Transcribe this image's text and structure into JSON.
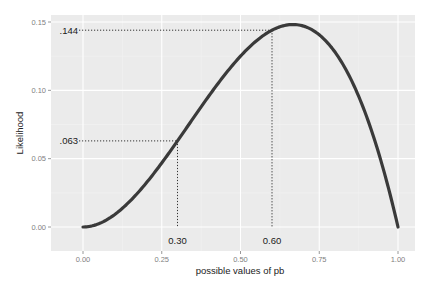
{
  "chart_data": {
    "type": "line",
    "title": "",
    "xlabel": "possible values of pb",
    "ylabel": "Likelihood",
    "xlim": [
      -0.1,
      1.05
    ],
    "ylim": [
      -0.018,
      0.157
    ],
    "x_ticks": [
      0.0,
      0.25,
      0.5,
      0.75,
      1.0
    ],
    "x_tick_labels": [
      "0.00",
      "0.25",
      "0.50",
      "0.75",
      "1.00"
    ],
    "y_ticks": [
      0.0,
      0.05,
      0.1,
      0.15
    ],
    "y_tick_labels": [
      "0.00",
      "0.05",
      "0.10",
      "0.15"
    ],
    "grid": true,
    "legend": "none",
    "series": [
      {
        "name": "likelihood",
        "formula": "p^2 * (1 - p)",
        "x": [
          0.0,
          0.05,
          0.1,
          0.15,
          0.2,
          0.25,
          0.3,
          0.35,
          0.4,
          0.45,
          0.5,
          0.55,
          0.6,
          0.65,
          0.6667,
          0.7,
          0.75,
          0.8,
          0.85,
          0.9,
          0.95,
          1.0
        ],
        "values": [
          0.0,
          0.0024,
          0.009,
          0.0191,
          0.032,
          0.0469,
          0.063,
          0.0796,
          0.096,
          0.1114,
          0.125,
          0.1361,
          0.144,
          0.1479,
          0.1481,
          0.147,
          0.1406,
          0.128,
          0.1084,
          0.081,
          0.0451,
          0.0
        ],
        "color": "#3a3a3a"
      }
    ],
    "annotations": [
      {
        "type": "guide",
        "x": 0.3,
        "y": 0.063,
        "x_label": "0.30",
        "y_label": ".063"
      },
      {
        "type": "guide",
        "x": 0.6,
        "y": 0.144,
        "x_label": "0.60",
        "y_label": ".144"
      }
    ]
  },
  "style": {
    "panel_bg": "#ebebeb",
    "grid_major": "#ffffff",
    "grid_minor": "#f4f4f4",
    "line_color": "#3a3a3a",
    "guide_color": "#333333"
  }
}
